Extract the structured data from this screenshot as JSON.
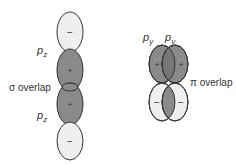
{
  "sigma": {
    "label_top": "p",
    "label_top_sub": "z",
    "label_bottom": "p",
    "label_bottom_sub": "z",
    "overlap_label": "σ overlap",
    "lobe_signs": [
      "−",
      "+",
      "+",
      "−"
    ]
  },
  "pi": {
    "label_left": "p",
    "label_left_sub": "y",
    "label_right": "p",
    "label_right_sub": "y",
    "overlap_label": "π overlap",
    "lobe_signs_top": [
      "+",
      "+"
    ],
    "lobe_signs_bottom": [
      "−",
      "−"
    ]
  },
  "colors": {
    "dark_lobe": "#8a8a8a",
    "light_lobe": "#efefef",
    "outline": "#333333"
  }
}
